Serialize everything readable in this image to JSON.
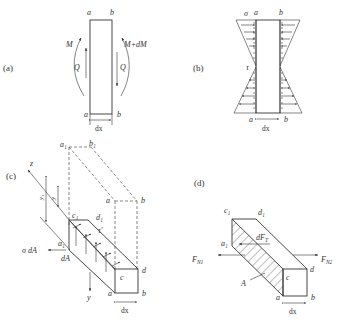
{
  "panels": {
    "a": {
      "tag": "(a)",
      "top_left": "a",
      "top_right": "b",
      "bottom_left": "a",
      "bottom_right": "b",
      "moment_left": "M",
      "moment_right": "M+dM",
      "shear_left": "Q",
      "shear_right": "Q",
      "width_label": "dx"
    },
    "b": {
      "tag": "(b)",
      "sigma": "σ",
      "tau": "τ",
      "top_left": "a",
      "top_right": "b",
      "bottom_left": "a",
      "bottom_right": "b",
      "width_label": "dx"
    },
    "c": {
      "tag": "(c)",
      "axis_z": "z",
      "axis_y": "y",
      "dim_y1": "y₁",
      "dim_y": "y",
      "a1": "a₁",
      "b1": "b₁",
      "a_top": "a",
      "b_top": "b",
      "c1": "c₁",
      "d1": "d₁",
      "tau_prime": "τ′",
      "a1_small": "a₁",
      "sigma_dA": "σ dA",
      "dA": "dA",
      "c": "c",
      "d": "d",
      "a": "a",
      "b": "b",
      "width_label": "dx"
    },
    "d": {
      "tag": "(d)",
      "c1": "c₁",
      "d1": "d₁",
      "a1": "a₁",
      "dFT": "dF",
      "dFT_sub": "T",
      "FN1": "F",
      "FN1_sub": "N1",
      "FN2": "F",
      "FN2_sub": "N2",
      "star": "*",
      "A_star": "A",
      "c": "c",
      "d": "d",
      "a": "a",
      "b": "b",
      "width_label": "dx"
    }
  }
}
